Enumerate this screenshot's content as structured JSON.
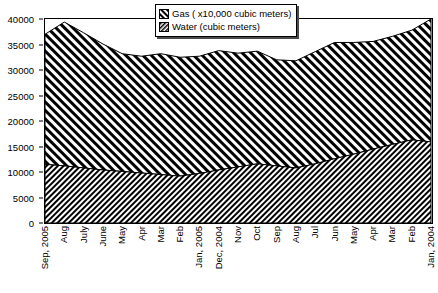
{
  "chart_data": {
    "type": "area",
    "stacked": true,
    "title": "",
    "xlabel": "",
    "ylabel": "",
    "ylim": [
      0,
      40000
    ],
    "ytick_values": [
      0,
      5000,
      10000,
      15000,
      20000,
      25000,
      30000,
      35000,
      40000
    ],
    "ytick_labels": [
      "0",
      "5000",
      "10000",
      "15000",
      "20000",
      "25000",
      "30000",
      "35000",
      "40000"
    ],
    "grid": false,
    "legend_position": "top-center",
    "categories": [
      "Sep, 2005",
      "Aug",
      "July",
      "June",
      "May",
      "Apr",
      "Mar",
      "Feb",
      "Jan, 2005",
      "Dec, 2004",
      "Nov",
      "Oct",
      "Sep",
      "Aug",
      "Jul",
      "Jun",
      "May",
      "Apr",
      "Mar",
      "Feb",
      "Jan, 2004"
    ],
    "series": [
      {
        "name": "Water (cubic meters)",
        "values": [
          11500,
          11200,
          10800,
          10400,
          10100,
          9800,
          9500,
          9200,
          9700,
          10400,
          11000,
          11600,
          11200,
          10800,
          11600,
          12600,
          13500,
          14500,
          15400,
          16300,
          15900
        ]
      },
      {
        "name": "Gas ( x10,000 cubic meters)",
        "values": [
          25500,
          28200,
          26500,
          24700,
          23100,
          22900,
          23700,
          23300,
          23000,
          23400,
          22300,
          22100,
          20800,
          21000,
          22000,
          22800,
          21900,
          21100,
          21200,
          21500,
          24100
        ]
      }
    ],
    "totals": [
      37000,
      39400,
      37300,
      35100,
      33200,
      32700,
      33200,
      32500,
      32700,
      33800,
      33300,
      33700,
      32000,
      31800,
      33600,
      35400,
      35400,
      35600,
      36600,
      37800,
      40000
    ]
  },
  "legend": {
    "entries": [
      {
        "label": "Gas ( x10,000 cubic meters)",
        "swatch": "hatch-forward"
      },
      {
        "label": "Water (cubic meters)",
        "swatch": "hatch-back-dense"
      }
    ]
  }
}
